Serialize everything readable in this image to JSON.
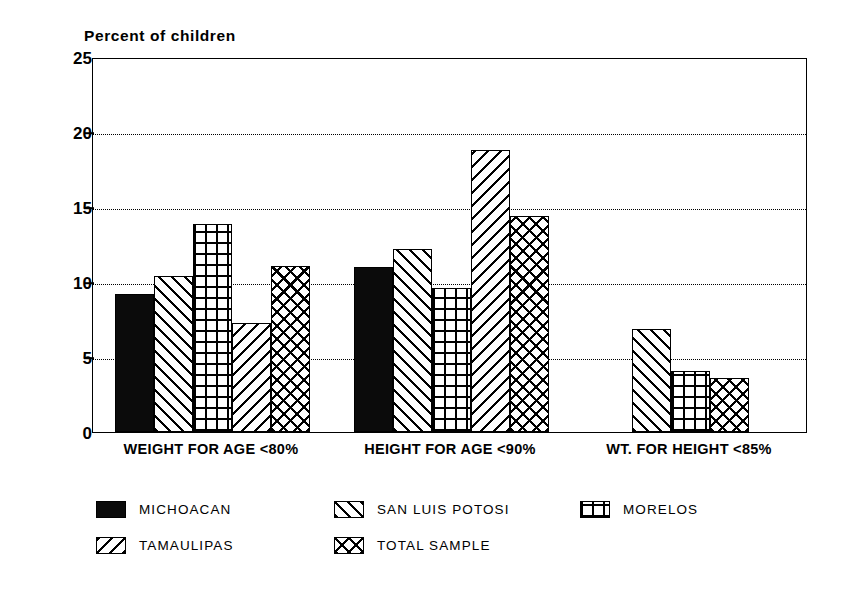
{
  "chart_data": {
    "type": "bar",
    "title": "",
    "ylabel": "Percent of children",
    "xlabel": "",
    "ylim": [
      0,
      25
    ],
    "yticks": [
      0,
      5,
      10,
      15,
      20,
      25
    ],
    "grid": "horizontal-dotted",
    "legend_position": "below-plot",
    "categories": [
      "WEIGHT FOR AGE <80%",
      "HEIGHT FOR AGE <90%",
      "WT. FOR HEIGHT <85%"
    ],
    "series": [
      {
        "name": "MICHOACAN",
        "pattern": "solid-black",
        "values": [
          9.2,
          11.0,
          null
        ]
      },
      {
        "name": "SAN LUIS POTOSI",
        "pattern": "forward-diagonal",
        "values": [
          10.4,
          12.2,
          6.9
        ]
      },
      {
        "name": "MORELOS",
        "pattern": "square-grid",
        "values": [
          13.9,
          9.6,
          4.1
        ]
      },
      {
        "name": "TAMAULIPAS",
        "pattern": "back-diagonal",
        "values": [
          7.3,
          18.8,
          null
        ]
      },
      {
        "name": "TOTAL SAMPLE",
        "pattern": "diagonal-crosshatch",
        "values": [
          11.1,
          14.4,
          3.6
        ]
      }
    ],
    "legend_entries": [
      {
        "label": "MICHOACAN",
        "pattern": "solid-black"
      },
      {
        "label": "SAN LUIS POTOSI",
        "pattern": "forward-diagonal"
      },
      {
        "label": "MORELOS",
        "pattern": "square-grid"
      },
      {
        "label": "TAMAULIPAS",
        "pattern": "back-diagonal"
      },
      {
        "label": "TOTAL SAMPLE",
        "pattern": "diagonal-crosshatch"
      }
    ]
  },
  "axis": {
    "title": "Percent of children",
    "ytick_labels": [
      "25",
      "20",
      "15",
      "10",
      "5",
      "0"
    ]
  },
  "categories": {
    "c0": "WEIGHT FOR AGE <80%",
    "c1": "HEIGHT FOR AGE <90%",
    "c2": "WT. FOR HEIGHT <85%"
  },
  "legend": {
    "l0": "MICHOACAN",
    "l1": "SAN LUIS POTOSI",
    "l2": "MORELOS",
    "l3": "TAMAULIPAS",
    "l4": "TOTAL SAMPLE"
  }
}
